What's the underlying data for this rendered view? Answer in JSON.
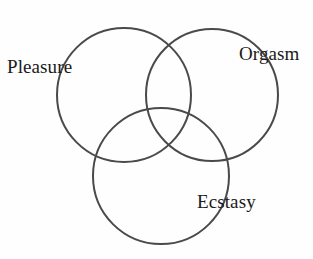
{
  "figure": {
    "type": "venn-diagram",
    "background_color": "#fefefe",
    "stroke_color": "#4a4a4a",
    "stroke_width": 2,
    "set_count": 3,
    "labels": {
      "pleasure": "Pleasure",
      "orgasm": "Orgasm",
      "ecstasy": "Ecstasy"
    }
  },
  "chart_data": {
    "type": "venn",
    "title": "",
    "xlabel": "",
    "ylabel": "",
    "sets": [
      {
        "name": "Pleasure",
        "label": "Pleasure",
        "cx": 124,
        "cy": 95,
        "r": 67,
        "label_x": 7,
        "label_y": 57
      },
      {
        "name": "Orgasm",
        "label": "Orgasm",
        "cx": 212,
        "cy": 95,
        "r": 66,
        "label_x": 239,
        "label_y": 44
      },
      {
        "name": "Ecstasy",
        "label": "Ecstasy",
        "cx": 161,
        "cy": 176,
        "r": 68,
        "label_x": 197,
        "label_y": 192
      }
    ],
    "regions": [],
    "values": [],
    "legend": [],
    "grid": false
  }
}
